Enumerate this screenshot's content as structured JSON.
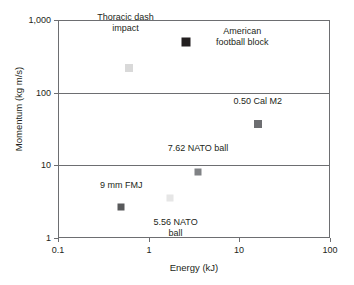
{
  "chart_data": {
    "type": "scatter",
    "title": "",
    "xlabel": "Energy (kJ)",
    "ylabel": "Momentum (kg m/s)",
    "xscale": "log",
    "yscale": "log",
    "xlim": [
      0.1,
      100
    ],
    "ylim": [
      1,
      1000
    ],
    "xticks": [
      "0.1",
      "1",
      "10",
      "100"
    ],
    "xtick_values": [
      0.1,
      1,
      10,
      100
    ],
    "yticks": [
      "1",
      "10",
      "100",
      "1,000"
    ],
    "ytick_values": [
      1,
      10,
      100,
      1000
    ],
    "grid": "horizontal",
    "legend": "none",
    "points": [
      {
        "name": "thoracic-dash-impact",
        "label": "Thoracic dash\nimpact",
        "x": 0.6,
        "y": 220,
        "color": "#d9d9d9",
        "size": 8,
        "label_dx": -3,
        "label_dy": -34
      },
      {
        "name": "american-football-block",
        "label": "American\nfootball block",
        "x": 2.6,
        "y": 500,
        "color": "#231f20",
        "size": 9,
        "label_dx": 56,
        "label_dy": -5
      },
      {
        "name": "0-50-cal-m2",
        "label": "0.50 Cal M2",
        "x": 16,
        "y": 37,
        "color": "#6d6e71",
        "size": 8,
        "label_dx": 0,
        "label_dy": -17
      },
      {
        "name": "7-62-nato-ball",
        "label": "7.62 NATO ball",
        "x": 3.5,
        "y": 8.2,
        "color": "#808285",
        "size": 7,
        "label_dx": 0,
        "label_dy": -18
      },
      {
        "name": "9-mm-fmj",
        "label": "9 mm FMJ",
        "x": 0.5,
        "y": 2.7,
        "color": "#58595b",
        "size": 7,
        "label_dx": 0,
        "label_dy": -16
      },
      {
        "name": "5-56-nato-ball",
        "label": "5.56 NATO\nball",
        "x": 1.7,
        "y": 3.5,
        "color": "#e6e6e6",
        "size": 7,
        "label_dx": 6,
        "label_dy": 19
      }
    ]
  },
  "axes": {
    "frame_color": "#6d6e71"
  }
}
